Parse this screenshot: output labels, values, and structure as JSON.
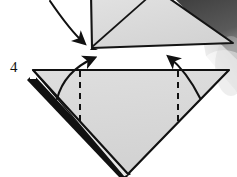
{
  "figure": {
    "kind": "origami-fold-diagram",
    "step_label": "4",
    "canvas": {
      "width": 237,
      "height": 177
    },
    "background_color": "#ffffff"
  },
  "colors": {
    "paper_face": "#d9d9d9",
    "paper_face_light": "#e8e8e8",
    "paper_edge_dark": "#1a1a1a",
    "shadow_dark": "#4a4a4a",
    "shadow_mid": "#9a9a9a",
    "shadow_soft": "#c9c9c9",
    "line_stroke": "#111111",
    "text": "#111111"
  },
  "shapes": {
    "upper_model": {
      "name": "upper-folded-model",
      "description": "partially cropped triangular folded paper at top of frame",
      "points": "91,0 160,0 232,42 92,48",
      "fill": "#dcdcdc",
      "crease_line": {
        "from": [
          92,
          47
        ],
        "to": [
          150,
          0
        ]
      }
    },
    "main_triangle": {
      "name": "main-triangle",
      "description": "large downward-pointing triangle, the current state of the model",
      "points": "33,70 228,70 128,173",
      "fill": "#d9d9d9"
    },
    "layer_edge": {
      "name": "hidden-layer-edge",
      "description": "thick dark band along lower-left showing stacked paper layers",
      "points": "33,76 126,176 120,176 29,80"
    },
    "shadow_band": {
      "name": "cast-shadow-band",
      "description": "dark diagonal shadow wedge in the upper right corner",
      "points": "176,0 237,0 237,52 196,20"
    }
  },
  "fold_lines": [
    {
      "name": "left-fold-crease",
      "style": "dashed",
      "x": 80,
      "y1": 71,
      "y2": 121
    },
    {
      "name": "right-fold-crease",
      "style": "dashed",
      "x": 178,
      "y1": 71,
      "y2": 121
    }
  ],
  "arrows": [
    {
      "name": "top-transfer-arrow",
      "direction": "down-right",
      "description": "curved arrow from upper left descending toward the upper model vertex",
      "path": "M 50,2 C 62,22 74,36 85,44",
      "head_at": [
        85,
        44
      ],
      "head_angle": 40
    },
    {
      "name": "left-fold-arrow",
      "direction": "up-right",
      "description": "curved arrow showing left flap folding up and to the right",
      "path": "M 58,98 C 63,80 76,66 96,58",
      "head_at": [
        97,
        57
      ],
      "head_angle": -27
    },
    {
      "name": "right-fold-arrow",
      "direction": "up-left",
      "description": "curved arrow showing right flap folding up and to the left",
      "path": "M 199,97 C 190,80 180,66 168,56",
      "head_at": [
        167,
        55
      ],
      "head_angle": -140
    }
  ],
  "annotations": {
    "step_number": "4"
  }
}
